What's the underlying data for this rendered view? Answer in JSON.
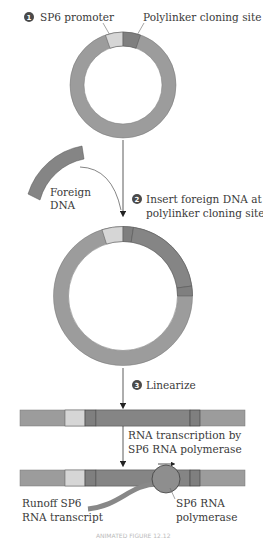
{
  "steps": [
    {
      "number": "1",
      "label": ""
    },
    {
      "number": "2",
      "label_line1": "Insert foreign DNA at",
      "label_line2": "polylinker cloning site"
    },
    {
      "number": "3",
      "label": "Linearize"
    }
  ],
  "labels": {
    "sp6_promoter": "SP6 promoter",
    "polylinker": "Polylinker cloning site",
    "foreign_dna_line1": "Foreign",
    "foreign_dna_line2": "DNA",
    "transcription_line1": "RNA transcription by",
    "transcription_line2": "SP6 RNA polymerase",
    "runoff_line1": "Runoff SP6",
    "runoff_line2": "RNA transcript",
    "polymerase_line1": "SP6 RNA",
    "polymerase_line2": "polymerase",
    "caption": "ANIMATED FIGURE 12.12"
  },
  "colors": {
    "vector": "#9c9c9c",
    "promoter": "#d6d6d6",
    "polylinker": "#7f7f7f",
    "foreign": "#858585",
    "polymerase": "#8e8e8e",
    "badge": "#4a4a4a",
    "line": "#3a3a3a"
  }
}
